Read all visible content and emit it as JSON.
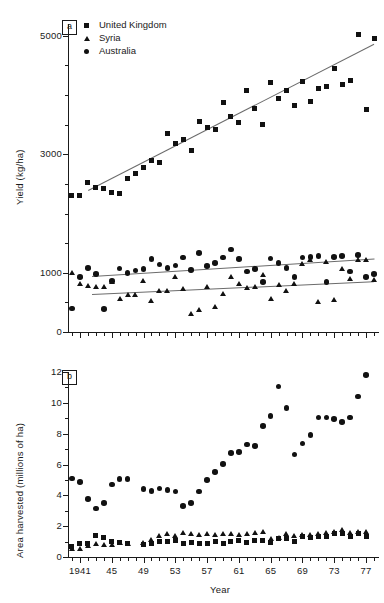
{
  "figure": {
    "panel_a_tag": "a",
    "panel_b_tag": "b",
    "xaxis_title": "Year"
  },
  "legend": {
    "items": [
      {
        "label": "United Kingdom",
        "marker": "square"
      },
      {
        "label": "Syria",
        "marker": "triangle"
      },
      {
        "label": "Australia",
        "marker": "circle"
      }
    ]
  },
  "chart_data": [
    {
      "type": "scatter",
      "panel": "a",
      "title": "",
      "xlabel": "Year",
      "ylabel": "Yield (kg/ha)",
      "xlim": [
        1939.5,
        1978.5
      ],
      "ylim": [
        0,
        5200
      ],
      "yticks": [
        0,
        1000,
        3000,
        5000
      ],
      "ytick_labels": [
        "0",
        "1000",
        "3000",
        "5000"
      ],
      "yticks_minor": [
        500,
        1500,
        2000,
        2500,
        3500,
        4000,
        4500
      ],
      "xticks": [
        1941,
        1945,
        1949,
        1953,
        1957,
        1961,
        1965,
        1969,
        1973,
        1977
      ],
      "xtick_labels": [
        "1941",
        "45",
        "49",
        "53",
        "57",
        "61",
        "65",
        "69",
        "73",
        "77"
      ],
      "grid": false,
      "legend_position": "top-left",
      "series": [
        {
          "name": "United Kingdom",
          "marker": "square",
          "x": [
            1940,
            1941,
            1942,
            1943,
            1944,
            1945,
            1946,
            1947,
            1948,
            1949,
            1950,
            1951,
            1952,
            1953,
            1954,
            1955,
            1956,
            1957,
            1958,
            1959,
            1960,
            1961,
            1962,
            1963,
            1964,
            1965,
            1966,
            1967,
            1968,
            1969,
            1970,
            1971,
            1972,
            1973,
            1974,
            1975,
            1976,
            1977,
            1978
          ],
          "y": [
            2300,
            2300,
            2520,
            2440,
            2420,
            2350,
            2330,
            2600,
            2680,
            2780,
            2900,
            2860,
            3350,
            3180,
            3250,
            3070,
            3550,
            3450,
            3420,
            3870,
            3630,
            3540,
            4080,
            3780,
            3500,
            4220,
            3950,
            4080,
            3830,
            4230,
            3900,
            4110,
            4140,
            4450,
            4180,
            4240,
            5020,
            3760,
            4960
          ]
        },
        {
          "name": "Australia",
          "marker": "circle",
          "x": [
            1940,
            1941,
            1942,
            1943,
            1944,
            1945,
            1946,
            1947,
            1948,
            1949,
            1950,
            1951,
            1952,
            1953,
            1954,
            1955,
            1956,
            1957,
            1958,
            1959,
            1960,
            1961,
            1962,
            1963,
            1964,
            1965,
            1966,
            1967,
            1968,
            1969,
            1970,
            1971,
            1972,
            1973,
            1974,
            1975,
            1976,
            1977,
            1978
          ],
          "y": [
            400,
            930,
            1080,
            980,
            390,
            860,
            1070,
            1000,
            1040,
            1060,
            1230,
            1140,
            1080,
            1120,
            1260,
            1050,
            1330,
            1110,
            1160,
            1260,
            1390,
            1230,
            1020,
            1060,
            840,
            1240,
            1160,
            1080,
            930,
            1260,
            1270,
            1280,
            840,
            1270,
            1280,
            1020,
            1300,
            930,
            980
          ]
        },
        {
          "name": "Syria",
          "marker": "triangle",
          "x": [
            1940,
            1941,
            1942,
            1943,
            1944,
            1945,
            1946,
            1947,
            1948,
            1949,
            1950,
            1951,
            1952,
            1953,
            1954,
            1955,
            1956,
            1957,
            1958,
            1959,
            1960,
            1961,
            1962,
            1963,
            1964,
            1965,
            1966,
            1967,
            1968,
            1969,
            1970,
            1971,
            1972,
            1973,
            1974,
            1975,
            1976,
            1977,
            1978
          ],
          "y": [
            1000,
            820,
            780,
            760,
            760,
            850,
            560,
            630,
            620,
            870,
            530,
            700,
            700,
            930,
            730,
            300,
            380,
            760,
            420,
            640,
            930,
            820,
            740,
            760,
            960,
            560,
            790,
            700,
            820,
            1150,
            1210,
            500,
            1190,
            540,
            1060,
            900,
            1210,
            1210,
            880
          ]
        }
      ],
      "trendlines": [
        {
          "series": "United Kingdom",
          "x0": 1942,
          "y0": 2400,
          "x1": 1978,
          "y1": 4870
        },
        {
          "series": "Australia",
          "x0": 1942.5,
          "y0": 950,
          "x1": 1978,
          "y1": 1245
        },
        {
          "series": "Syria",
          "x0": 1942.5,
          "y0": 645,
          "x1": 1978,
          "y1": 860
        }
      ]
    },
    {
      "type": "scatter",
      "panel": "b",
      "title": "",
      "xlabel": "Year",
      "ylabel": "Area harvested (millions of ha)",
      "xlim": [
        1939.5,
        1978.5
      ],
      "ylim": [
        0,
        12
      ],
      "yticks": [
        0,
        2,
        4,
        6,
        8,
        10,
        12
      ],
      "ytick_labels": [
        "0",
        "2",
        "4",
        "6",
        "8",
        "10",
        "12"
      ],
      "yticks_minor": [
        1,
        3,
        5,
        7,
        9,
        11
      ],
      "xticks": [
        1941,
        1945,
        1949,
        1953,
        1957,
        1961,
        1965,
        1969,
        1973,
        1977
      ],
      "xtick_labels": [
        "1941",
        "45",
        "49",
        "53",
        "57",
        "61",
        "65",
        "69",
        "73",
        "77"
      ],
      "grid": false,
      "legend_position": "none",
      "series": [
        {
          "name": "Australia",
          "marker": "circle",
          "x": [
            1940,
            1941,
            1942,
            1943,
            1944,
            1945,
            1946,
            1947,
            1949,
            1950,
            1951,
            1952,
            1953,
            1954,
            1955,
            1956,
            1957,
            1958,
            1959,
            1960,
            1961,
            1962,
            1963,
            1964,
            1965,
            1966,
            1967,
            1968,
            1969,
            1970,
            1971,
            1972,
            1973,
            1974,
            1975,
            1976,
            1977
          ],
          "y": [
            5.1,
            4.85,
            3.75,
            3.15,
            3.5,
            4.7,
            5.05,
            5.05,
            4.4,
            4.3,
            4.45,
            4.35,
            4.25,
            3.3,
            3.5,
            4.25,
            5.0,
            5.5,
            6.05,
            6.75,
            6.8,
            7.3,
            7.2,
            8.5,
            9.15,
            11.05,
            9.65,
            6.65,
            7.35,
            7.9,
            9.05,
            9.05,
            8.95,
            8.75,
            9.05,
            10.4
          ]
        },
        {
          "name": "Syria",
          "marker": "triangle",
          "x": [
            1940,
            1941,
            1942,
            1943,
            1944,
            1945,
            1946,
            1947,
            1949,
            1950,
            1951,
            1952,
            1953,
            1954,
            1955,
            1956,
            1957,
            1958,
            1959,
            1960,
            1961,
            1962,
            1963,
            1964,
            1965,
            1966,
            1967,
            1968,
            1969,
            1970,
            1971,
            1972,
            1973,
            1974,
            1975,
            1976,
            1977
          ],
          "y": [
            0.55,
            0.5,
            0.75,
            0.85,
            0.8,
            0.8,
            0.9,
            0.85,
            0.9,
            1.1,
            1.35,
            1.5,
            1.4,
            1.55,
            1.5,
            1.45,
            1.5,
            1.45,
            1.5,
            1.5,
            1.45,
            1.5,
            1.55,
            1.65,
            1.15,
            1.25,
            1.5,
            1.4,
            1.45,
            1.45,
            1.5,
            1.55,
            1.6,
            1.75,
            1.55,
            1.6,
            1.6
          ]
        },
        {
          "name": "United Kingdom",
          "marker": "square",
          "x": [
            1940,
            1941,
            1942,
            1943,
            1944,
            1945,
            1946,
            1947,
            1949,
            1950,
            1951,
            1952,
            1953,
            1954,
            1955,
            1956,
            1957,
            1958,
            1959,
            1960,
            1961,
            1962,
            1963,
            1964,
            1965,
            1966,
            1967,
            1968,
            1969,
            1970,
            1971,
            1972,
            1973,
            1974,
            1975,
            1976,
            1977
          ],
          "y": [
            0.7,
            0.85,
            0.9,
            1.4,
            1.25,
            1.0,
            0.95,
            0.9,
            0.8,
            0.9,
            1.0,
            1.0,
            1.05,
            0.9,
            0.95,
            0.9,
            0.9,
            1.0,
            0.85,
            1.0,
            1.05,
            0.95,
            1.05,
            1.1,
            0.95,
            1.2,
            1.2,
            1.0,
            1.3,
            1.25,
            1.35,
            1.35,
            1.5,
            1.5,
            1.35,
            1.5,
            1.3
          ]
        }
      ],
      "trendlines": []
    }
  ]
}
